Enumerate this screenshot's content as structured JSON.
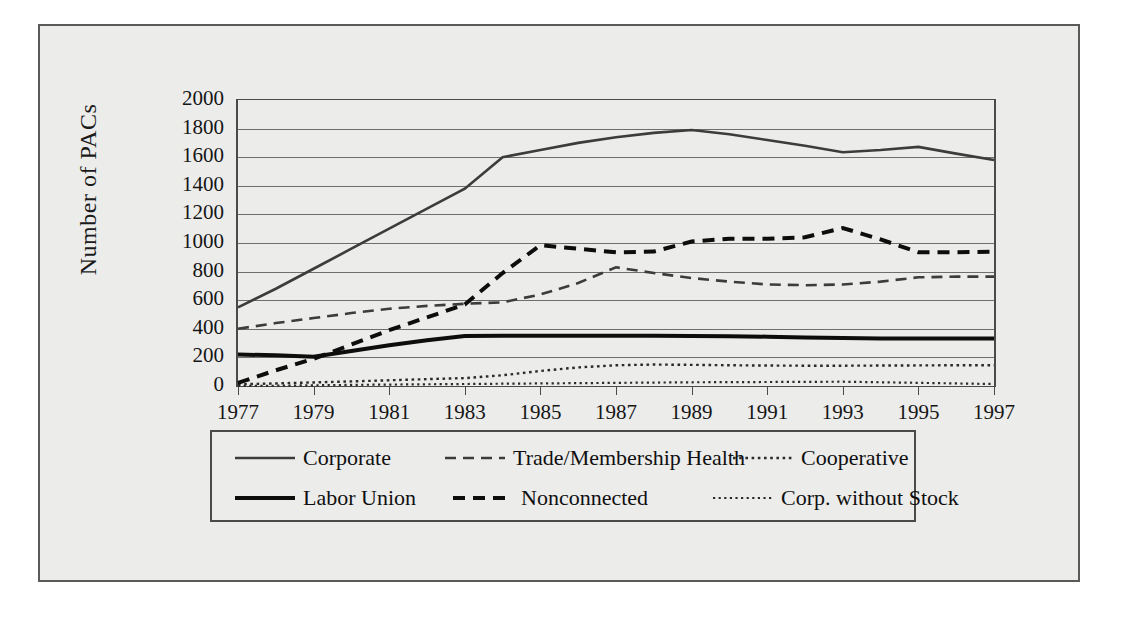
{
  "chart_data": {
    "type": "line",
    "title": "",
    "xlabel": "",
    "ylabel": "Number of PACs",
    "xlim": [
      1977,
      1997
    ],
    "ylim": [
      0,
      2000
    ],
    "ytick_step": 200,
    "grid": true,
    "legend_position": "bottom",
    "x": [
      1977,
      1978,
      1979,
      1980,
      1981,
      1982,
      1983,
      1984,
      1985,
      1986,
      1987,
      1988,
      1989,
      1990,
      1991,
      1992,
      1993,
      1994,
      1995,
      1996,
      1997
    ],
    "xtick_labels": [
      "1977",
      "1979",
      "1981",
      "1983",
      "1985",
      "1987",
      "1989",
      "1991",
      "1993",
      "1995",
      "1997"
    ],
    "ytick_labels": [
      "0",
      "200",
      "400",
      "600",
      "800",
      "1000",
      "1200",
      "1400",
      "1600",
      "1800",
      "2000"
    ],
    "series": [
      {
        "name": "Corporate",
        "style": "solid",
        "width": 2.6,
        "color": "#3c3c3a",
        "values": [
          550,
          680,
          820,
          960,
          1100,
          1240,
          1380,
          1600,
          1650,
          1700,
          1740,
          1770,
          1790,
          1760,
          1720,
          1680,
          1635,
          1650,
          1672,
          1625,
          1580
        ]
      },
      {
        "name": "Trade/Membership Health",
        "style": "dashed-thin",
        "width": 2.6,
        "color": "#3c3c3a",
        "values": [
          400,
          440,
          475,
          510,
          540,
          560,
          575,
          585,
          640,
          720,
          830,
          790,
          755,
          730,
          710,
          705,
          710,
          730,
          760,
          765,
          765
        ]
      },
      {
        "name": "Cooperative",
        "style": "dotted",
        "width": 2.4,
        "color": "#2a2a28",
        "values": [
          12,
          18,
          25,
          32,
          40,
          48,
          55,
          75,
          105,
          130,
          145,
          150,
          148,
          145,
          143,
          142,
          142,
          143,
          144,
          145,
          145
        ]
      },
      {
        "name": "Labor Union",
        "style": "solid-heavy",
        "width": 4.0,
        "color": "#0d0d0d",
        "values": [
          220,
          215,
          205,
          245,
          285,
          320,
          350,
          352,
          352,
          352,
          352,
          352,
          350,
          348,
          345,
          340,
          335,
          332,
          332,
          332,
          332
        ]
      },
      {
        "name": "Nonconnected",
        "style": "dashed-heavy",
        "width": 4.0,
        "color": "#0d0d0d",
        "values": [
          22,
          110,
          190,
          290,
          390,
          480,
          570,
          790,
          985,
          960,
          935,
          940,
          1010,
          1030,
          1030,
          1040,
          1105,
          1025,
          935,
          935,
          940
        ]
      },
      {
        "name": "Corp. without Stock",
        "style": "dotted-fine",
        "width": 2.2,
        "color": "#2a2a28",
        "values": [
          0,
          2,
          5,
          8,
          10,
          12,
          14,
          16,
          18,
          20,
          22,
          24,
          26,
          27,
          28,
          29,
          30,
          26,
          22,
          18,
          14
        ]
      }
    ]
  },
  "legend": {
    "rows": [
      [
        {
          "label": "Corporate",
          "style": "solid"
        },
        {
          "label": "Trade/Membership Health",
          "style": "dashed-thin"
        },
        {
          "label": "Cooperative",
          "style": "dotted"
        }
      ],
      [
        {
          "label": "Labor Union",
          "style": "solid-heavy"
        },
        {
          "label": "Nonconnected",
          "style": "dashed-heavy"
        },
        {
          "label": "Corp. without Stock",
          "style": "dotted-fine"
        }
      ]
    ]
  },
  "axis": {
    "y_title": "Number of PACs"
  },
  "colors": {
    "paper": "#ececeb",
    "frame": "#5a5a58",
    "axis": "#4a4a48",
    "grid": "#6e6e6c",
    "ink": "#101010"
  }
}
